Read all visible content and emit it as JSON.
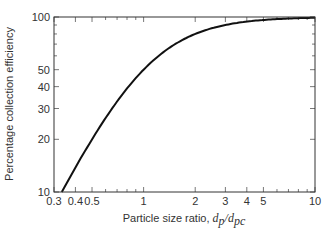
{
  "chart_data": {
    "type": "line",
    "title": "",
    "xlabel": "Particle size ratio, d_p/d_pc",
    "xlabel_parts": {
      "prefix": "Particle size ratio, ",
      "d": "d",
      "p": "p",
      "slash": "/",
      "d2": "d",
      "pc": "pc"
    },
    "ylabel": "Percentage collection efficiency",
    "xscale": "log",
    "yscale": "log",
    "xlim": [
      0.3,
      10
    ],
    "ylim": [
      10,
      100
    ],
    "grid": false,
    "x_ticks": [
      0.3,
      0.4,
      0.5,
      1,
      2,
      3,
      4,
      5,
      10
    ],
    "x_tick_labels": [
      "0.3",
      "0.4",
      "0.5",
      "1",
      "2",
      "3",
      "4",
      "5",
      "10"
    ],
    "x_minor_ticks": [
      0.6,
      0.7,
      0.8,
      0.9,
      6,
      7,
      8,
      9
    ],
    "y_ticks": [
      10,
      20,
      30,
      40,
      50,
      100
    ],
    "y_tick_labels": [
      "10",
      "20",
      "30",
      "40",
      "50",
      "100"
    ],
    "y_minor_ticks": [
      60,
      70,
      80,
      90
    ],
    "series": [
      {
        "name": "Collection efficiency",
        "x": [
          0.333,
          0.4,
          0.5,
          0.6,
          0.7,
          0.8,
          1,
          1.5,
          2,
          3,
          4,
          5,
          7,
          10
        ],
        "values": [
          10,
          13.8,
          20,
          26.5,
          32.9,
          39,
          50,
          69.2,
          80,
          90,
          94.1,
          96.2,
          98,
          99
        ]
      }
    ]
  }
}
